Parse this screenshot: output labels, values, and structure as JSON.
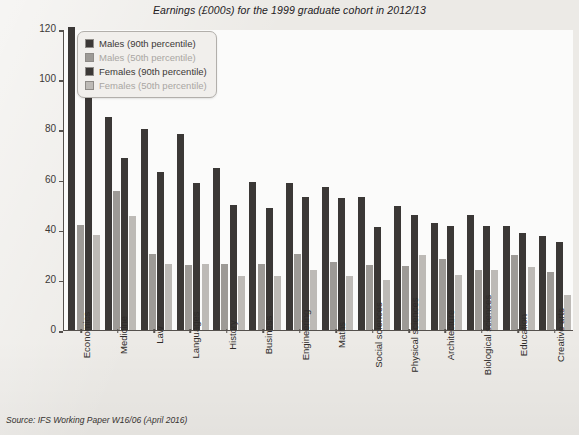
{
  "chart_title": "Earnings (£000s) for the 1999 graduate cohort in 2012/13",
  "source_note": "Source: IFS Working Paper W16/06 (April 2016)",
  "legend": {
    "items": [
      {
        "label": "Males (90th percentile)",
        "color": "#3b3836",
        "muted": false
      },
      {
        "label": "Males (50th percentile)",
        "color": "#9d9a96",
        "muted": true
      },
      {
        "label": "Females (90th percentile)",
        "color": "#3b3836",
        "muted": false
      },
      {
        "label": "Females (50th percentile)",
        "color": "#bdbab6",
        "muted": true
      }
    ]
  },
  "colors": {
    "males_90": "#3b3836",
    "males_50": "#9d9a96",
    "females_90": "#3b3836",
    "females_50": "#bdbab6",
    "page_background": "#eceae6",
    "plot_background": "#fbfbfa",
    "axis": "#55514d"
  },
  "chart_data": {
    "type": "bar",
    "title": "Earnings (£000s) for the 1999 graduate cohort in 2012/13",
    "xlabel": "",
    "ylabel": "£ per annum (000s)",
    "ylim": [
      0,
      120
    ],
    "yticks": [
      0,
      20,
      40,
      60,
      80,
      100,
      120
    ],
    "grid": false,
    "legend_position": "top-left",
    "categories": [
      "Economics",
      "Medicine",
      "Law",
      "Languages",
      "History",
      "Business",
      "Engineering",
      "Maths",
      "Social sciences",
      "Physical sciences",
      "Architecture",
      "Biological sciences",
      "Education",
      "Creative arts"
    ],
    "series": [
      {
        "name": "Males (90th percentile)",
        "values": [
          121,
          85,
          80,
          78,
          64.5,
          59,
          58.5,
          57,
          53,
          49.5,
          42.5,
          46,
          41.5,
          37.5
        ]
      },
      {
        "name": "Males (50th percentile)",
        "values": [
          42,
          55.5,
          30.5,
          26,
          26.5,
          26.5,
          30.5,
          27,
          26,
          25.5,
          28.5,
          24,
          30,
          23
        ]
      },
      {
        "name": "Females (90th percentile)",
        "values": [
          94,
          68.5,
          63,
          58.5,
          50,
          48.5,
          53,
          52.5,
          41,
          46,
          41.5,
          41.5,
          38.5,
          35
        ]
      },
      {
        "name": "Females (50th percentile)",
        "values": [
          38,
          45.5,
          26.5,
          26.5,
          21.5,
          21.5,
          24,
          21.5,
          20,
          30,
          22,
          24,
          25,
          14
        ]
      }
    ]
  }
}
